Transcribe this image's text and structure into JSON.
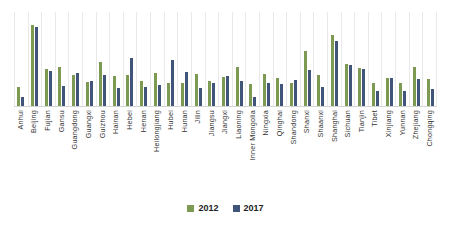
{
  "chart_data": {
    "type": "bar",
    "title": "",
    "subtitle": "",
    "xlabel": "",
    "ylabel": "",
    "grid": "vertical-only",
    "legend_position": "bottom-center",
    "ylim": [
      0,
      100
    ],
    "categories": [
      "Anhui",
      "Beijing",
      "Fujian",
      "Gansu",
      "Guangdong",
      "Guangxi",
      "Guizhou",
      "Hainan",
      "Hebei",
      "Henan",
      "Heilongjiang",
      "Hubei",
      "Hunan",
      "Jilin",
      "Jiangsu",
      "Jiangxi",
      "Liaoning",
      "Inner Mongolia",
      "Ningxia",
      "Qinghai",
      "Shandong",
      "Shanxi",
      "Shaanxi",
      "Shanghai",
      "Sichuan",
      "Tianjin",
      "Tibet",
      "Xinjiang",
      "Yunnan",
      "Zhejiang",
      "Chongqing"
    ],
    "series": [
      {
        "name": "2012",
        "color": "#7d9a52",
        "values": [
          20,
          86,
          39,
          41,
          33,
          26,
          47,
          32,
          33,
          27,
          35,
          25,
          24,
          34,
          27,
          31,
          42,
          23,
          34,
          30,
          25,
          58,
          33,
          76,
          45,
          40,
          24,
          30,
          24,
          41,
          29
        ]
      },
      {
        "name": "2017",
        "color": "#41547a",
        "values": [
          10,
          84,
          37,
          21,
          35,
          27,
          33,
          19,
          51,
          20,
          22,
          49,
          36,
          19,
          25,
          32,
          27,
          10,
          24,
          23,
          28,
          38,
          20,
          69,
          44,
          39,
          16,
          30,
          16,
          29,
          18
        ]
      }
    ]
  },
  "legend": {
    "items": [
      {
        "label": "2012",
        "color": "#7d9a52"
      },
      {
        "label": "2017",
        "color": "#41547a"
      }
    ]
  }
}
